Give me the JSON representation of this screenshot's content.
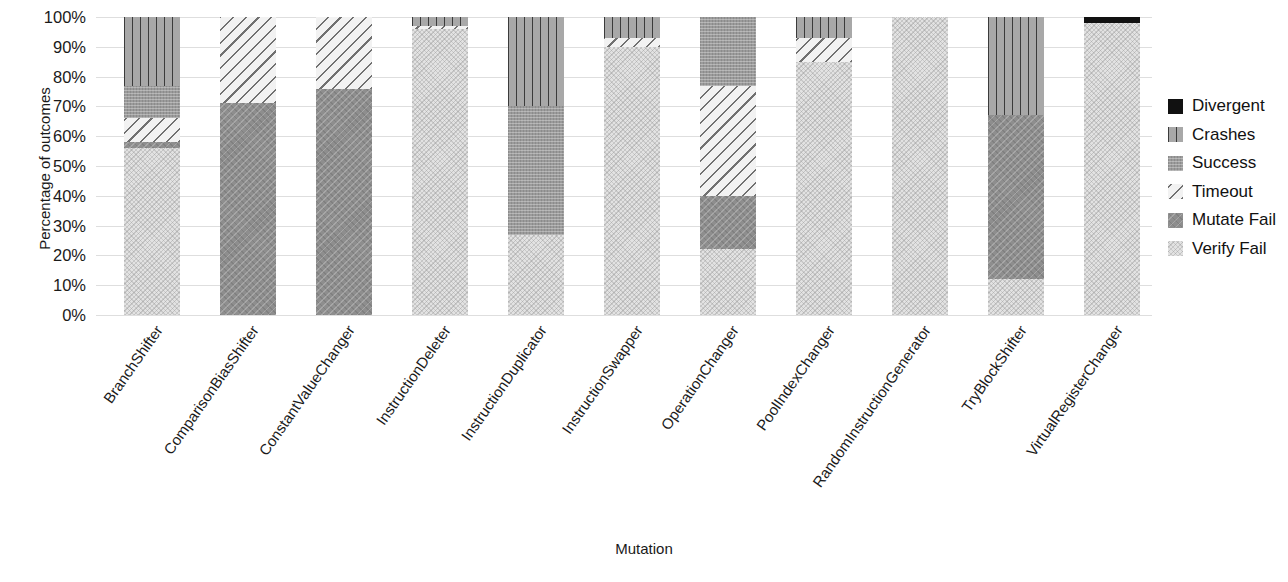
{
  "chart_data": {
    "type": "bar",
    "subtype": "stacked-bar-100-percent",
    "title": "",
    "xlabel": "Mutation",
    "ylabel": "Percentage of outcomes",
    "ylim": [
      0,
      100
    ],
    "ytick_labels": [
      "100%",
      "90%",
      "80%",
      "70%",
      "60%",
      "50%",
      "40%",
      "30%",
      "20%",
      "10%",
      "0%"
    ],
    "ytick_values": [
      100,
      90,
      80,
      70,
      60,
      50,
      40,
      30,
      20,
      10,
      0
    ],
    "grid": true,
    "legend_position": "right",
    "categories": [
      "BranchShifter",
      "ComparisonBiasShifter",
      "ConstantValueChanger",
      "InstructionDeleter",
      "InstructionDuplicator",
      "InstructionSwapper",
      "OperationChanger",
      "PoolIndexChanger",
      "RandomInstructionGenerator",
      "TryBlockShifter",
      "VirtualRegisterChanger"
    ],
    "series": [
      {
        "name": "Verify Fail",
        "key": "verifyfail",
        "color": "#e2e2e2",
        "pattern": "dense-dots",
        "values": [
          56,
          0,
          0,
          96,
          27,
          90,
          22,
          85,
          100,
          12,
          98
        ]
      },
      {
        "name": "Mutate Fail",
        "key": "mutatefail",
        "color": "#8e8e8e",
        "pattern": "cross-hatch",
        "values": [
          2,
          71,
          76,
          0,
          0,
          0,
          18,
          0,
          0,
          55,
          0
        ]
      },
      {
        "name": "Timeout",
        "key": "timeout",
        "color": "#f2f2f2",
        "pattern": "diagonal-hatch",
        "values": [
          8,
          29,
          24,
          1,
          0,
          3,
          37,
          8,
          0,
          0,
          0
        ]
      },
      {
        "name": "Success",
        "key": "success",
        "color": "#9b9b9b",
        "pattern": "fine-grid",
        "values": [
          11,
          0,
          0,
          0,
          43,
          0,
          23,
          0,
          0,
          0,
          0
        ]
      },
      {
        "name": "Crashes",
        "key": "crashes",
        "color": "#a8a8a8",
        "pattern": "vertical-lines",
        "values": [
          23,
          0,
          0,
          3,
          30,
          7,
          0,
          7,
          0,
          33,
          0
        ]
      },
      {
        "name": "Divergent",
        "key": "divergent",
        "color": "#111111",
        "pattern": "solid",
        "values": [
          0,
          0,
          0,
          0,
          0,
          0,
          0,
          0,
          0,
          0,
          2
        ]
      }
    ],
    "stack_order_bottom_to_top": [
      "verifyfail",
      "mutatefail",
      "timeout",
      "success",
      "crashes",
      "divergent"
    ],
    "legend_entries": [
      {
        "label": "Divergent",
        "key": "divergent",
        "color": "#111111"
      },
      {
        "label": "Crashes",
        "key": "crashes",
        "color": "#a8a8a8"
      },
      {
        "label": "Success",
        "key": "success",
        "color": "#9b9b9b"
      },
      {
        "label": "Timeout",
        "key": "timeout",
        "color": "#f2f2f2"
      },
      {
        "label": "Mutate Fail",
        "key": "mutatefail",
        "color": "#8e8e8e"
      },
      {
        "label": "Verify Fail",
        "key": "verifyfail",
        "color": "#e2e2e2"
      }
    ]
  }
}
